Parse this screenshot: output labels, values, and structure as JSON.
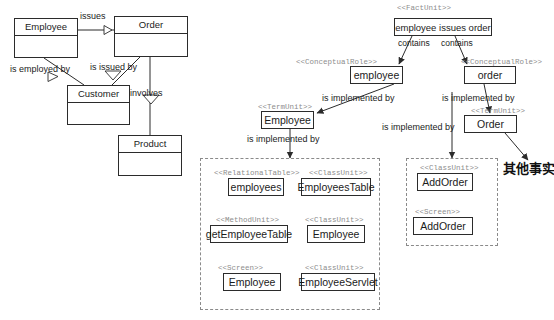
{
  "diagram": {
    "annotation_cjk": "其他事实"
  },
  "conceptual_model": {
    "classes": [
      {
        "name": "Employee",
        "x": 14,
        "y": 18,
        "w": 64,
        "h": 40
      },
      {
        "name": "Order",
        "x": 114,
        "y": 16,
        "w": 74,
        "h": 41
      },
      {
        "name": "Customer",
        "x": 67,
        "y": 85,
        "w": 63,
        "h": 40
      },
      {
        "name": "Product",
        "x": 118,
        "y": 135,
        "w": 64,
        "h": 41
      }
    ],
    "edges": [
      {
        "label": "issues",
        "x": 80,
        "y": 11
      },
      {
        "label": "is employed by",
        "x": 10,
        "y": 64
      },
      {
        "label": "is issued by",
        "x": 90,
        "y": 62
      },
      {
        "label": "involves",
        "x": 130,
        "y": 88
      }
    ]
  },
  "fact_layer": {
    "fact_unit": {
      "stereotype": "<<FactUnit>>",
      "stereotype_x": 397,
      "stereotype_y": 4,
      "label": "employee issues order",
      "x": 394,
      "y": 18,
      "w": 98,
      "h": 18
    },
    "contains_labels": [
      {
        "label": "contains",
        "x": 398,
        "y": 38
      },
      {
        "label": "contains",
        "x": 441,
        "y": 38
      }
    ],
    "roles": [
      {
        "stereotype": "<<ConceptualRole>>",
        "stereotype_x": 296,
        "stereotype_y": 58,
        "label": "employee",
        "x": 350,
        "y": 66,
        "w": 53,
        "h": 18
      },
      {
        "stereotype": "<<ConceptualRole>>",
        "stereotype_x": 461,
        "stereotype_y": 58,
        "label": "order",
        "x": 464,
        "y": 66,
        "w": 52,
        "h": 18
      }
    ],
    "terms": [
      {
        "stereotype": "<<TermUnit>>",
        "stereotype_x": 258,
        "stereotype_y": 103,
        "label": "Employee",
        "x": 261,
        "y": 111,
        "w": 53,
        "h": 18
      },
      {
        "stereotype": "<<TermUnit>>",
        "stereotype_x": 471,
        "stereotype_y": 107,
        "label": "Order",
        "x": 464,
        "y": 115,
        "w": 53,
        "h": 18
      }
    ],
    "implemented_by_labels": [
      {
        "label": "is implemented by",
        "x": 322,
        "y": 93
      },
      {
        "label": "is implemented by",
        "x": 442,
        "y": 93
      },
      {
        "label": "is implemented by",
        "x": 247,
        "y": 134
      },
      {
        "label": "is implemented by",
        "x": 382,
        "y": 122
      }
    ]
  },
  "implementation_groups": [
    {
      "name": "employee-implementation-group",
      "x": 200,
      "y": 158,
      "w": 180,
      "h": 152,
      "units": [
        {
          "stereotype": "<<RelationalTable>>",
          "stereotype_x": 214,
          "stereotype_y": 169,
          "label": "employees",
          "x": 228,
          "y": 178,
          "w": 56,
          "h": 18,
          "size": "big"
        },
        {
          "stereotype": "<<ClassUnit>>",
          "stereotype_x": 309,
          "stereotype_y": 169,
          "label": "EmployeesTable",
          "x": 301,
          "y": 178,
          "w": 70,
          "h": 18,
          "size": "big"
        },
        {
          "stereotype": "<<MethodUnit>>",
          "stereotype_x": 216,
          "stereotype_y": 216,
          "label": "getEmployeeTable",
          "x": 210,
          "y": 225,
          "w": 78,
          "h": 18,
          "size": "big"
        },
        {
          "stereotype": "<<ClassUnit>>",
          "stereotype_x": 305,
          "stereotype_y": 216,
          "label": "Employee",
          "x": 307,
          "y": 225,
          "w": 58,
          "h": 18,
          "size": "big"
        },
        {
          "stereotype": "<<Screen>>",
          "stereotype_x": 218,
          "stereotype_y": 264,
          "label": "Employee",
          "x": 223,
          "y": 273,
          "w": 58,
          "h": 18,
          "size": "big"
        },
        {
          "stereotype": "<<ClassUnit>>",
          "stereotype_x": 305,
          "stereotype_y": 264,
          "label": "EmployeeServlet",
          "x": 301,
          "y": 273,
          "w": 74,
          "h": 18,
          "size": "big"
        }
      ]
    },
    {
      "name": "order-implementation-group",
      "x": 406,
      "y": 158,
      "w": 92,
      "h": 88,
      "units": [
        {
          "stereotype": "<<ClassUnit>>",
          "stereotype_x": 420,
          "stereotype_y": 164,
          "label": "AddOrder",
          "x": 417,
          "y": 173,
          "w": 56,
          "h": 18,
          "size": "big"
        },
        {
          "stereotype": "<<Screen>>",
          "stereotype_x": 415,
          "stereotype_y": 208,
          "label": "AddOrder",
          "x": 413,
          "y": 217,
          "w": 60,
          "h": 18,
          "size": "big"
        }
      ]
    }
  ],
  "colors": {
    "stroke": "#2b2b2b",
    "stereotype_text": "#8d8d8d",
    "dashed_border": "#8a8a8a",
    "background": "#ffffff"
  }
}
